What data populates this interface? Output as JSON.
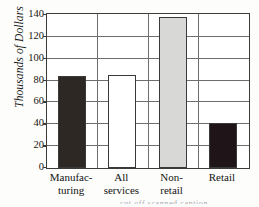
{
  "chart_data": {
    "type": "bar",
    "title": "",
    "xlabel": "",
    "ylabel": "Thousands of Dollars",
    "ylim": [
      0,
      140
    ],
    "yticks": [
      0,
      20,
      40,
      60,
      80,
      100,
      120,
      140
    ],
    "grid": true,
    "legend": "none",
    "categories": [
      "Manufac-\nturing",
      "All\nservices",
      "Non-\nretail",
      "Retail"
    ],
    "category_lines": [
      [
        "Manufac-",
        "turing"
      ],
      [
        "All",
        "services"
      ],
      [
        "Non-",
        "retail"
      ],
      [
        "Retail"
      ]
    ],
    "values": [
      84,
      85,
      138,
      41
    ],
    "bar_colors": [
      "#2e2824",
      "#ffffff",
      "#d8d8d6",
      "#1f1518"
    ],
    "bar_edge_color": "#3a3a3a",
    "axis_color": "#3b3b3b",
    "grid_color": "#6e6e6e"
  },
  "artifact": {
    "bottom_text": "cut off scanned caption"
  }
}
